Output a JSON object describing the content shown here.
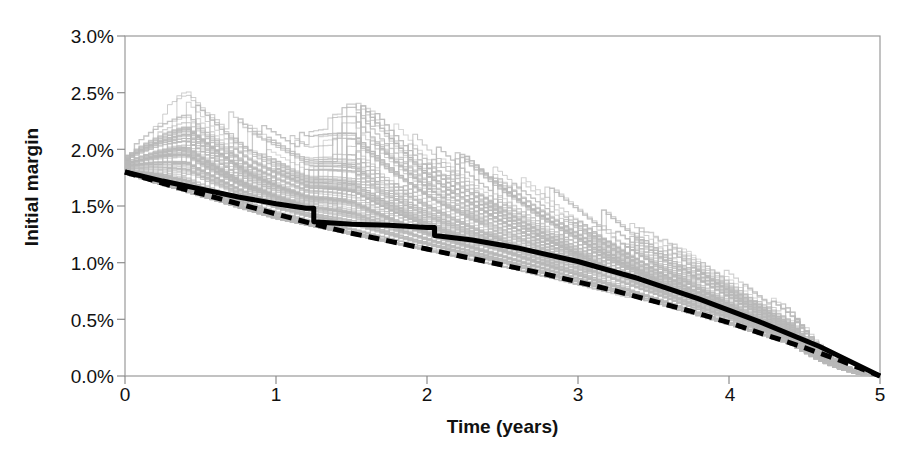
{
  "chart_data": {
    "type": "line",
    "title": "",
    "xlabel": "Time (years)",
    "ylabel": "Initial margin",
    "xlim": [
      0,
      5
    ],
    "ylim": [
      0,
      0.03
    ],
    "grid": false,
    "legend_position": "none",
    "x_ticks": [
      "0",
      "1",
      "2",
      "3",
      "4",
      "5"
    ],
    "x_tick_values": [
      0,
      1,
      2,
      3,
      4,
      5
    ],
    "y_ticks": [
      "0.0%",
      "0.5%",
      "1.0%",
      "1.5%",
      "2.0%",
      "2.5%",
      "3.0%"
    ],
    "y_tick_values": [
      0.0,
      0.005,
      0.01,
      0.015,
      0.02,
      0.025,
      0.03
    ],
    "colors": {
      "scenario_paths": "#b8b8b8",
      "mean_line": "#000000",
      "dashed_line": "#000000",
      "axis": "#808080",
      "text": "#111111",
      "background": "#ffffff"
    },
    "annotations": [
      "~100 light-gray simulated scenario paths, piecewise/step-like, all start near 1.8%-1.95% and decay to 0.0% at t=5",
      "Highest outlier path peaks at about 2.47% near t=0.4",
      "A second prominent outlier jumps to about 2.30% at t=1.5",
      "Thick solid black line is the mean path with visible step-downs near t=1.25 and t=2.05",
      "Thick dashed black line runs consistently below the solid mean line and converges with it at t=5"
    ],
    "series": [
      {
        "name": "Mean (solid black)",
        "style": "solid",
        "color": "#000000",
        "width": 4,
        "x": [
          0,
          0.25,
          0.5,
          0.75,
          1.0,
          1.2,
          1.25,
          1.25,
          1.5,
          1.75,
          2.0,
          2.05,
          2.05,
          2.3,
          2.6,
          3.0,
          3.4,
          3.8,
          4.2,
          4.6,
          5.0
        ],
        "values": [
          0.018,
          0.0172,
          0.0165,
          0.0158,
          0.0152,
          0.0148,
          0.0148,
          0.0136,
          0.0134,
          0.0133,
          0.0131,
          0.0131,
          0.0124,
          0.012,
          0.0113,
          0.0101,
          0.0086,
          0.0068,
          0.0048,
          0.0026,
          0.0
        ]
      },
      {
        "name": "Reference (dashed black)",
        "style": "dashed",
        "color": "#000000",
        "width": 4,
        "x": [
          0,
          0.25,
          0.5,
          0.75,
          1.0,
          1.25,
          1.5,
          1.75,
          2.0,
          2.25,
          2.5,
          2.75,
          3.0,
          3.25,
          3.5,
          3.75,
          4.0,
          4.25,
          4.5,
          4.75,
          5.0
        ],
        "values": [
          0.018,
          0.017,
          0.0161,
          0.0152,
          0.0143,
          0.0134,
          0.0126,
          0.0119,
          0.0112,
          0.0105,
          0.0098,
          0.0091,
          0.0083,
          0.0075,
          0.0066,
          0.0057,
          0.0047,
          0.0036,
          0.0025,
          0.0013,
          0.0
        ]
      },
      {
        "name": "Scenario envelope upper",
        "style": "solid",
        "color": "#b8b8b8",
        "width": 1,
        "x": [
          0,
          0.4,
          0.8,
          1.2,
          1.5,
          2.0,
          2.5,
          3.0,
          3.5,
          4.0,
          4.5,
          5.0
        ],
        "values": [
          0.0195,
          0.0247,
          0.0215,
          0.0205,
          0.023,
          0.0196,
          0.0172,
          0.0148,
          0.0118,
          0.0086,
          0.0048,
          0.0
        ]
      },
      {
        "name": "Scenario envelope lower",
        "style": "solid",
        "color": "#b8b8b8",
        "width": 1,
        "x": [
          0,
          0.5,
          1.0,
          1.5,
          2.0,
          2.5,
          3.0,
          3.5,
          4.0,
          4.5,
          5.0
        ],
        "values": [
          0.0178,
          0.0158,
          0.0138,
          0.0124,
          0.011,
          0.0096,
          0.008,
          0.0063,
          0.0044,
          0.0023,
          0.0
        ]
      }
    ],
    "scenario_count": 100,
    "scenario_start_range": [
      0.0178,
      0.0195
    ]
  },
  "axis": {
    "y_title": "Initial margin",
    "x_title": "Time (years)"
  }
}
